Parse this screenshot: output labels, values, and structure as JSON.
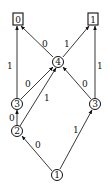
{
  "diagram": {
    "type": "binary-decision-diagram",
    "terminals": [
      {
        "id": "t0",
        "label": "0",
        "x": 18,
        "y": 19
      },
      {
        "id": "t1",
        "label": "1",
        "x": 93,
        "y": 19
      }
    ],
    "nodes": [
      {
        "id": "n4",
        "label": "4",
        "x": 58,
        "y": 62
      },
      {
        "id": "n3L",
        "label": "3",
        "x": 17,
        "y": 104
      },
      {
        "id": "n3R",
        "label": "3",
        "x": 95,
        "y": 104
      },
      {
        "id": "n2",
        "label": "2",
        "x": 17,
        "y": 131
      },
      {
        "id": "n1",
        "label": "1",
        "x": 57,
        "y": 175
      }
    ],
    "edges": [
      {
        "from": "n4",
        "to": "t0",
        "label": "0"
      },
      {
        "from": "n4",
        "to": "t1",
        "label": "1"
      },
      {
        "from": "n3L",
        "to": "t0",
        "label": "1"
      },
      {
        "from": "n3L",
        "to": "n4",
        "label": "0"
      },
      {
        "from": "n3R",
        "to": "t1",
        "label": "1"
      },
      {
        "from": "n3R",
        "to": "n4",
        "label": "0"
      },
      {
        "from": "n2",
        "to": "n3L",
        "label": "0"
      },
      {
        "from": "n2",
        "to": "n4",
        "label": "1"
      },
      {
        "from": "n1",
        "to": "n2",
        "label": "0"
      },
      {
        "from": "n1",
        "to": "n3R",
        "label": "1"
      }
    ]
  }
}
